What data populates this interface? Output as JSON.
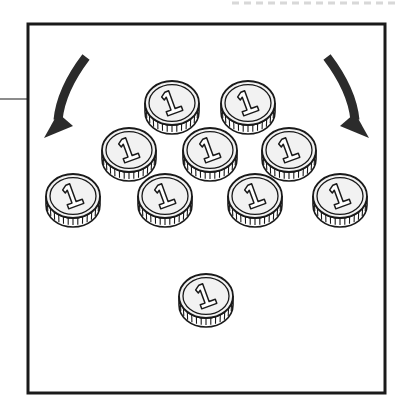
{
  "figure": {
    "title": "Coin grouping illustration",
    "background_color": "#ffffff",
    "ink_color": "#1a1a1a",
    "coin_face_color": "#f2f2f2",
    "coin_rim_color": "#ffffff",
    "frame": {
      "name": "outer-frame",
      "x": 28,
      "y": 24,
      "width": 357,
      "height": 369,
      "stroke_color": "#1a1a1a",
      "stroke_width": 3,
      "fill": "none"
    },
    "top_dashed_rule": {
      "name": "top-dashed-rule",
      "x1": 232,
      "x2": 399,
      "y": 3,
      "color": "#d8d8d8",
      "stroke_width": 3,
      "dash": "7 5"
    },
    "left_tick_rule": {
      "name": "left-margin-rule",
      "x1": 0,
      "x2": 28,
      "y": 99,
      "color": "#8c8c8c",
      "stroke_width": 2
    },
    "arrows": [
      {
        "name": "arrow-left-inward",
        "direction": "down-left",
        "color": "#2b2b2b",
        "start": [
          88,
          58
        ],
        "end": [
          62,
          136
        ]
      },
      {
        "name": "arrow-right-inward",
        "direction": "down-right",
        "color": "#2b2b2b",
        "start": [
          325,
          58
        ],
        "end": [
          351,
          136
        ]
      }
    ],
    "coin_label": "1",
    "coin_count_total": 11,
    "coin_count_in_pile": 10,
    "coin_count_separate": 1,
    "coin_size": {
      "rx": 27,
      "ry": 22,
      "rim_depth": 9
    },
    "rows": [
      {
        "name": "coin-row-top",
        "count": 2,
        "y": 103,
        "coins": [
          {
            "name": "coin-top-1",
            "cx": 172,
            "cy": 103,
            "value": "1"
          },
          {
            "name": "coin-top-2",
            "cx": 248,
            "cy": 103,
            "value": "1"
          }
        ]
      },
      {
        "name": "coin-row-middle",
        "count": 3,
        "y": 150,
        "coins": [
          {
            "name": "coin-mid-1",
            "cx": 129,
            "cy": 150,
            "value": "1"
          },
          {
            "name": "coin-mid-2",
            "cx": 210,
            "cy": 150,
            "value": "1"
          },
          {
            "name": "coin-mid-3",
            "cx": 289,
            "cy": 150,
            "value": "1"
          }
        ]
      },
      {
        "name": "coin-row-bottom",
        "count": 4,
        "y": 196,
        "coins": [
          {
            "name": "coin-bot-1",
            "cx": 73,
            "cy": 196,
            "value": "1"
          },
          {
            "name": "coin-bot-2",
            "cx": 165,
            "cy": 196,
            "value": "1"
          },
          {
            "name": "coin-bot-3",
            "cx": 255,
            "cy": 196,
            "value": "1"
          },
          {
            "name": "coin-bot-4",
            "cx": 340,
            "cy": 196,
            "value": "1"
          }
        ]
      },
      {
        "name": "coin-row-separate",
        "count": 1,
        "y": 297,
        "coins": [
          {
            "name": "coin-separate-1",
            "cx": 206,
            "cy": 296,
            "value": "1"
          }
        ]
      }
    ]
  }
}
